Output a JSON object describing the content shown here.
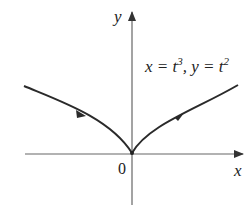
{
  "diagram": {
    "equation": {
      "x_part": "x = t",
      "x_exp": "3",
      "sep": ", ",
      "y_part": "y = t",
      "y_exp": "2"
    },
    "axes": {
      "x_label": "x",
      "y_label": "y",
      "origin_label": "0"
    },
    "curve": {
      "description": "semicubical parabola x = t^3, y = t^2 with cusp at origin",
      "direction": "left to right (increasing t)",
      "color": "#2a2a2a"
    },
    "colors": {
      "axis": "#555555",
      "text": "#222222",
      "background": "#ffffff"
    }
  }
}
